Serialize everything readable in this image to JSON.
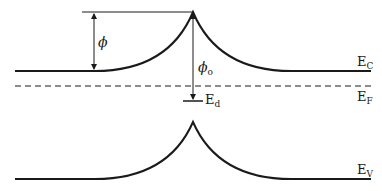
{
  "diagram": {
    "type": "band-diagram",
    "colors": {
      "line": "#1a1a1a",
      "background": "#ffffff"
    },
    "labels": {
      "phi": "ϕ",
      "phi0_main": "ϕ",
      "phi0_sub": "o",
      "ec_main": "E",
      "ec_sub": "C",
      "ef_main": "E",
      "ef_sub": "F",
      "ed_main": "E",
      "ed_sub": "d",
      "ev_main": "E",
      "ev_sub": "V"
    },
    "levels": {
      "conduction_band": {
        "y": 71,
        "peak_y": 12
      },
      "fermi_level": {
        "y": 86,
        "style": "dashed"
      },
      "defect_level": {
        "y": 101
      },
      "valence_band": {
        "y": 179,
        "peak_y": 122
      }
    }
  }
}
